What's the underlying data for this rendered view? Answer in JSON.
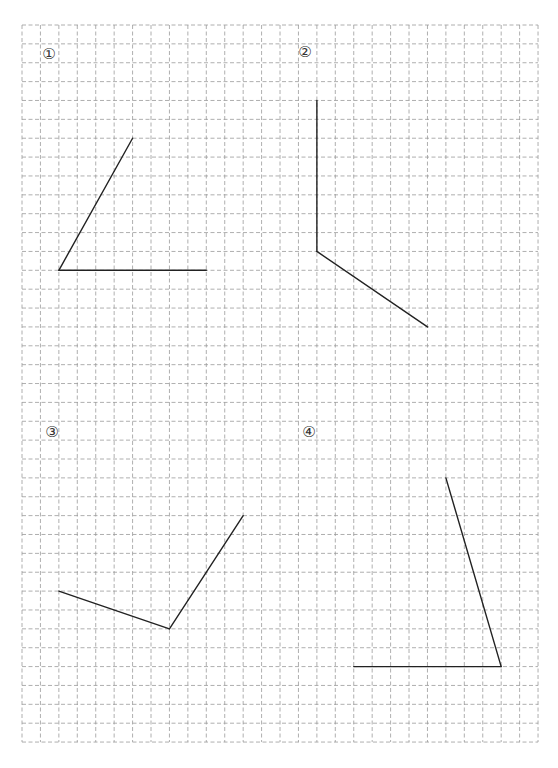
{
  "worksheet": {
    "grid": {
      "origin_x": 22,
      "origin_y": 25,
      "cell_width": 18.43,
      "cell_height": 18.87,
      "columns": 28,
      "rows": 38,
      "line_color": "#9a9a9a",
      "dash": "4 2.5"
    },
    "stroke_color": "#222222",
    "problems": [
      {
        "label": "①",
        "label_pos": [
          49,
          54
        ],
        "vertex": [
          2,
          13
        ],
        "ray_ends": [
          [
            6,
            6
          ],
          [
            10,
            13
          ]
        ]
      },
      {
        "label": "②",
        "label_pos": [
          305,
          52
        ],
        "vertex": [
          16,
          12
        ],
        "ray_ends": [
          [
            16,
            4
          ],
          [
            22,
            16
          ]
        ]
      },
      {
        "label": "③",
        "label_pos": [
          52,
          432
        ],
        "vertex": [
          8,
          32
        ],
        "ray_ends": [
          [
            2,
            30
          ],
          [
            12,
            26
          ]
        ]
      },
      {
        "label": "④",
        "label_pos": [
          309,
          432
        ],
        "vertex": [
          26,
          34
        ],
        "ray_ends": [
          [
            23,
            24
          ],
          [
            18,
            34
          ]
        ]
      }
    ]
  }
}
